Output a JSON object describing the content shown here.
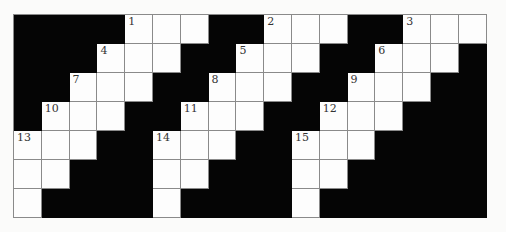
{
  "puzzle": {
    "rows": 7,
    "cols": 17,
    "colors": {
      "block": "#050505",
      "cell": "#fdfdfd",
      "line": "#8a8a8a"
    },
    "grid": [
      "####...##...##...",
      "###...##...##...#",
      "##...##...##...##",
      "#...##...##...###",
      "...##...##...####",
      "..###..###..#####",
      ".####.####.######"
    ],
    "numbers": [
      {
        "n": "1",
        "r": 0,
        "c": 4
      },
      {
        "n": "2",
        "r": 0,
        "c": 9
      },
      {
        "n": "3",
        "r": 0,
        "c": 14
      },
      {
        "n": "4",
        "r": 1,
        "c": 3
      },
      {
        "n": "5",
        "r": 1,
        "c": 8
      },
      {
        "n": "6",
        "r": 1,
        "c": 13
      },
      {
        "n": "7",
        "r": 2,
        "c": 2
      },
      {
        "n": "8",
        "r": 2,
        "c": 7
      },
      {
        "n": "9",
        "r": 2,
        "c": 12
      },
      {
        "n": "10",
        "r": 3,
        "c": 1
      },
      {
        "n": "11",
        "r": 3,
        "c": 6
      },
      {
        "n": "12",
        "r": 3,
        "c": 11
      },
      {
        "n": "13",
        "r": 4,
        "c": 0
      },
      {
        "n": "14",
        "r": 4,
        "c": 5
      },
      {
        "n": "15",
        "r": 4,
        "c": 10
      }
    ]
  }
}
